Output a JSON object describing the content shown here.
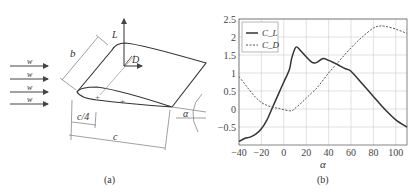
{
  "panel_a": {
    "caption": "(a)",
    "flow_labels": [
      "w",
      "w",
      "w",
      "w"
    ],
    "span_label": "b",
    "lift_label": "L",
    "drag_label": "D",
    "quarter_chord_label": "c/4",
    "chord_label": "c",
    "angle_label": "α"
  },
  "panel_b": {
    "caption": "(b)",
    "xlabel": "α"
  },
  "chart_data": {
    "type": "line",
    "title": "",
    "xlabel": "α",
    "ylabel": "",
    "xlim": [
      -40,
      110
    ],
    "ylim": [
      -1.0,
      2.5
    ],
    "xticks": [
      "-40",
      "-20",
      "0",
      "20",
      "40",
      "60",
      "80",
      "100"
    ],
    "yticks": [
      "2.5",
      "2",
      "1.5",
      "1",
      "0.5",
      "0",
      "-0.5"
    ],
    "grid": true,
    "legend_position": "upper left",
    "series": [
      {
        "name": "C_L",
        "style": "solid",
        "x": [
          -40,
          -35,
          -30,
          -25,
          -20,
          -15,
          -10,
          -5,
          0,
          5,
          7,
          10,
          12,
          15,
          20,
          25,
          28,
          30,
          35,
          40,
          45,
          50,
          55,
          60,
          70,
          80,
          90,
          100,
          110
        ],
        "y": [
          -0.9,
          -0.82,
          -0.78,
          -0.7,
          -0.55,
          -0.3,
          0.05,
          0.4,
          0.75,
          1.1,
          1.4,
          1.68,
          1.72,
          1.62,
          1.45,
          1.3,
          1.28,
          1.3,
          1.4,
          1.35,
          1.28,
          1.2,
          1.12,
          1.05,
          0.7,
          0.35,
          0.0,
          -0.3,
          -0.5
        ]
      },
      {
        "name": "C_D",
        "style": "dashed",
        "x": [
          -40,
          -35,
          -30,
          -25,
          -20,
          -15,
          -10,
          -5,
          0,
          5,
          8,
          10,
          15,
          20,
          25,
          30,
          40,
          50,
          60,
          70,
          80,
          85,
          90,
          100,
          110
        ],
        "y": [
          0.9,
          0.7,
          0.5,
          0.32,
          0.18,
          0.1,
          0.05,
          0.02,
          -0.02,
          -0.05,
          -0.04,
          0.02,
          0.15,
          0.3,
          0.45,
          0.6,
          1.0,
          1.35,
          1.7,
          2.0,
          2.25,
          2.3,
          2.3,
          2.22,
          2.1
        ]
      }
    ]
  }
}
